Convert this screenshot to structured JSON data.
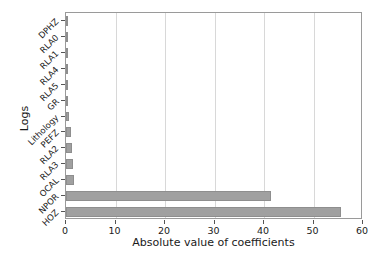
{
  "chart_data": {
    "type": "bar",
    "orientation": "horizontal",
    "title": "",
    "xlabel": "Absolute value of coefficients",
    "ylabel": "Logs",
    "xlim": [
      0,
      60
    ],
    "ylim": [
      0,
      13
    ],
    "xticks": [
      0,
      10,
      20,
      30,
      40,
      50,
      60
    ],
    "xticklabels": [
      "0",
      "10",
      "20",
      "30",
      "40",
      "50",
      "60"
    ],
    "grid": true,
    "grid_axis": "x",
    "legend": null,
    "bar_color": "#a0a0a0",
    "bar_edge_color": "#8e8e8e",
    "categories": [
      "DPHZ",
      "RLA0",
      "RLA1",
      "RLA4",
      "RLA5",
      "GR",
      "Lithology",
      "PEFZ",
      "RLA2",
      "RLA3",
      "OCAL",
      "NPOR",
      "HOZ"
    ],
    "values": [
      0.08,
      0.1,
      0.12,
      0.15,
      0.18,
      0.3,
      0.55,
      1.0,
      1.3,
      1.5,
      1.6,
      41.5,
      55.5
    ]
  }
}
